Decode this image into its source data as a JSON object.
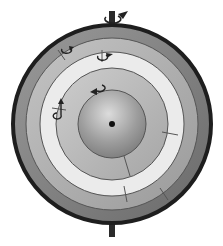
{
  "diagram": {
    "title": "",
    "center": {
      "x": 112,
      "y": 124
    },
    "axis": {
      "top": {
        "y1": 12,
        "y2": 27
      },
      "bottom": {
        "y1": 222,
        "y2": 237
      },
      "color": "#2a2a2a"
    },
    "layers": [
      {
        "name": "outer-shell",
        "radius": 100,
        "fill": "#7a7a7a",
        "stroke": "#1e1e1e",
        "stroke_width": 4
      },
      {
        "name": "shell-2",
        "radius": 86,
        "fill": "#a9a9a9",
        "stroke": "#555555",
        "stroke_width": 1
      },
      {
        "name": "shell-3",
        "radius": 72,
        "fill": "#e6e6e6",
        "stroke": "#555555",
        "stroke_width": 1
      },
      {
        "name": "shell-4",
        "radius": 56,
        "fill": "#b4b4b4",
        "stroke": "#555555",
        "stroke_width": 1
      },
      {
        "name": "core",
        "radius": 34,
        "fill": "#9a9a9a",
        "stroke": "#555555",
        "stroke_width": 1
      }
    ],
    "core_dot": {
      "radius": 3,
      "color": "#111111"
    },
    "rotation_markers": [
      {
        "name": "axis-rotation",
        "x": 112,
        "y": 16
      },
      {
        "name": "shell-1-rotation",
        "x": 66,
        "y": 50
      },
      {
        "name": "shell-2-rotation",
        "x": 102,
        "y": 57
      },
      {
        "name": "shell-3-rotation",
        "x": 60,
        "y": 105
      },
      {
        "name": "shell-4-rotation",
        "x": 95,
        "y": 89
      }
    ]
  }
}
